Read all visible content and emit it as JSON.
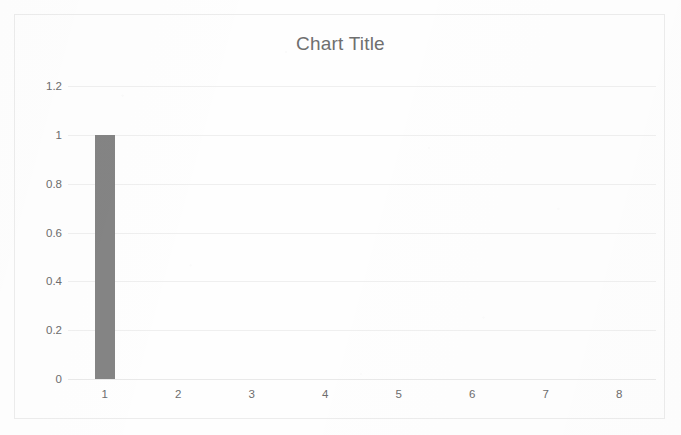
{
  "chart_data": {
    "type": "bar",
    "title": "Chart Title",
    "xlabel": "",
    "ylabel": "",
    "categories": [
      "1",
      "2",
      "3",
      "4",
      "5",
      "6",
      "7",
      "8"
    ],
    "values": [
      1,
      0,
      0,
      0,
      0,
      0,
      0,
      0
    ],
    "series": [
      {
        "name": "Series 1",
        "values": [
          1,
          0,
          0,
          0,
          0,
          0,
          0,
          0
        ],
        "color": "#848484"
      }
    ],
    "ylim": [
      0,
      1.2
    ],
    "y_ticks": [
      "0",
      "0.2",
      "0.4",
      "0.6",
      "0.8",
      "1",
      "1.2"
    ],
    "y_tick_values": [
      0,
      0.2,
      0.4,
      0.6,
      0.8,
      1,
      1.2
    ],
    "grid": true,
    "grid_axis": "y",
    "legend": false,
    "legend_position": "none",
    "bar_color": "#848484",
    "title_color": "#6f6f6f",
    "tick_label_color": "#6d6d6d",
    "gridline_color": "#efefef",
    "border_color": "#ececec",
    "background_color": "#fefefe"
  }
}
